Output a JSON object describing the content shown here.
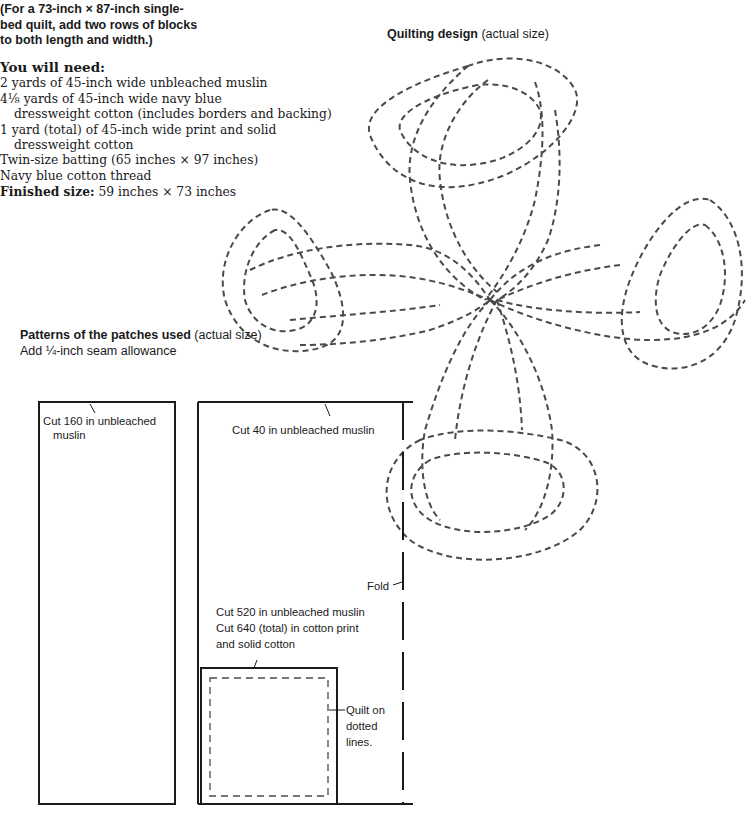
{
  "intro": {
    "lines": [
      "(For a 73-inch × 87-inch single-",
      "bed quilt, add two rows of blocks",
      "to both length and width.)"
    ]
  },
  "materials": {
    "heading": "You will need:",
    "items": [
      "2 yards of 45-inch wide unbleached muslin",
      "4⅛ yards of 45-inch wide navy blue",
      "dressweight cotton (includes borders and backing)",
      "1 yard (total) of 45-inch wide print and solid",
      "dressweight cotton",
      "Twin-size batting (65 inches × 97 inches)",
      "Navy blue cotton thread"
    ],
    "finished_label": "Finished size:",
    "finished_value": " 59 inches × 73 inches"
  },
  "quilting_design": {
    "title": "Quilting design",
    "subtitle": " (actual size)"
  },
  "patterns": {
    "title": "Patterns of the patches used",
    "subtitle": " (actual size)",
    "seam_note": "Add ¼-inch seam allowance",
    "tall_patch": {
      "line1": "Cut 160 in unbleached",
      "line2": "muslin"
    },
    "wide_patch": {
      "label": "Cut 40 in unbleached muslin"
    },
    "fold_label": "Fold",
    "large_patch": {
      "line1": "Cut 520 in unbleached muslin",
      "line2": "Cut 640 (total) in cotton print",
      "line3": "and solid cotton"
    },
    "square_patch": {
      "line1": "Quilt on",
      "line2": "dotted",
      "line3": "lines."
    }
  },
  "colors": {
    "ink": "#1a1a1a",
    "dashes": "#4a4a4a",
    "paper": "#ffffff"
  }
}
